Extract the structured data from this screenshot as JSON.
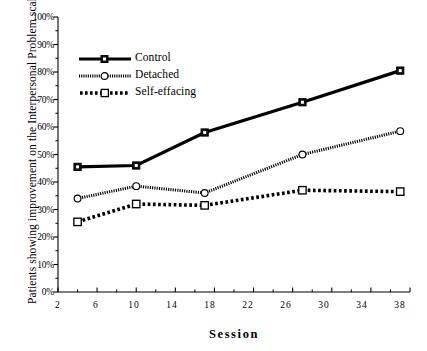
{
  "chart_data": {
    "type": "line",
    "title": "",
    "xlabel": "Session",
    "ylabel": "Patients showing improvement on the Interpersonal Problem scales (%)",
    "x": [
      4,
      10,
      17,
      27,
      37
    ],
    "xlim": [
      2,
      38
    ],
    "ylim": [
      0,
      100
    ],
    "xticks": [
      2,
      6,
      10,
      14,
      18,
      22,
      26,
      30,
      34,
      38
    ],
    "xtick_labels": [
      "2",
      "6",
      "10",
      "14",
      "18",
      "22",
      "26",
      "30",
      "34",
      "38"
    ],
    "xminor_ticks": [
      4,
      8,
      12,
      16,
      20,
      24,
      28,
      32,
      36
    ],
    "yticks": [
      0,
      10,
      20,
      30,
      40,
      50,
      60,
      70,
      80,
      90,
      100
    ],
    "ytick_labels": [
      "0%",
      "10%",
      "20%",
      "30%",
      "40%",
      "50%",
      "60%",
      "70%",
      "80%",
      "90%",
      "100%"
    ],
    "yminor_ticks": [
      5,
      15,
      25,
      35,
      45,
      55,
      65,
      75,
      85,
      95
    ],
    "grid": false,
    "legend_position": "upper-left",
    "series": [
      {
        "name": "Control",
        "values": [
          45.5,
          46.0,
          58.0,
          69.0,
          80.5
        ],
        "color": "#000000",
        "line_style": "solid",
        "marker": "filled-square"
      },
      {
        "name": "Detached",
        "values": [
          34.0,
          38.5,
          36.0,
          50.0,
          58.5
        ],
        "color": "#000000",
        "line_style": "fine-dotted",
        "marker": "open-circle"
      },
      {
        "name": "Self-effacing",
        "values": [
          25.5,
          32.0,
          31.5,
          37.0,
          36.5
        ],
        "color": "#000000",
        "line_style": "thick-dotted",
        "marker": "open-square"
      }
    ]
  },
  "axes": {
    "y_axis_label": "Patients showing improvement on the Interpersonal Problem scales (%)",
    "x_axis_label": "Session"
  },
  "legend": {
    "items": [
      {
        "label": "Control"
      },
      {
        "label": "Detached"
      },
      {
        "label": "Self-effacing"
      }
    ]
  }
}
